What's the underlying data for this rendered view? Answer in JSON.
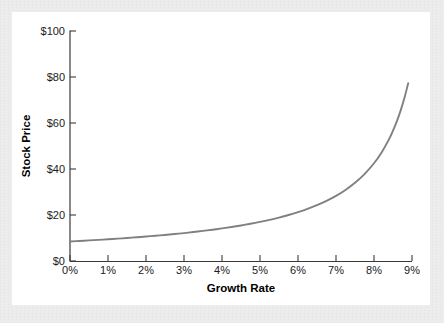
{
  "figure": {
    "background_color": "#ededed",
    "card_color": "#ffffff"
  },
  "chart_data": {
    "type": "line",
    "title": "",
    "xlabel": "Growth Rate",
    "ylabel": "Stock Price",
    "xlim": [
      0,
      9
    ],
    "ylim": [
      0,
      100
    ],
    "grid": false,
    "legend": null,
    "x_tick_labels": [
      "0%",
      "1%",
      "2%",
      "3%",
      "4%",
      "5%",
      "6%",
      "7%",
      "8%",
      "9%"
    ],
    "x_tick_values": [
      0,
      1,
      2,
      3,
      4,
      5,
      6,
      7,
      8,
      9
    ],
    "y_tick_labels": [
      "$0",
      "$20",
      "$40",
      "$60",
      "$80",
      "$100"
    ],
    "y_tick_values": [
      0,
      20,
      40,
      60,
      80,
      100
    ],
    "series": [
      {
        "name": "Stock Price",
        "color": "#808080",
        "x": [
          0,
          0.25,
          0.5,
          0.75,
          1,
          1.25,
          1.5,
          1.75,
          2,
          2.25,
          2.5,
          2.75,
          3,
          3.25,
          3.5,
          3.75,
          4,
          4.25,
          4.5,
          4.75,
          5,
          5.25,
          5.5,
          5.75,
          6,
          6.25,
          6.5,
          6.75,
          7,
          7.25,
          7.5,
          7.75,
          8,
          8.2,
          8.4,
          8.5,
          8.6,
          8.7,
          8.8,
          8.9
        ],
        "values": [
          8.5,
          8.72,
          8.95,
          9.19,
          9.44,
          9.71,
          10.0,
          10.3,
          10.63,
          10.97,
          11.33,
          11.72,
          12.14,
          12.59,
          13.08,
          13.6,
          14.17,
          14.78,
          15.45,
          16.19,
          17.0,
          17.89,
          18.89,
          20.0,
          21.25,
          22.67,
          24.29,
          26.15,
          28.33,
          30.91,
          34.0,
          37.78,
          42.5,
          47.22,
          53.12,
          56.67,
          60.71,
          65.38,
          70.83,
          77.27
        ]
      }
    ],
    "curve_endpoints": {
      "start": {
        "x": "0%",
        "y": "$8.5"
      },
      "end": {
        "x": "8.9%",
        "y": "$92"
      }
    }
  }
}
